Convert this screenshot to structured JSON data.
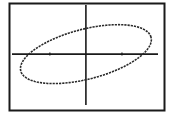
{
  "chart_data": {
    "type": "line",
    "title": "",
    "xlabel": "",
    "ylabel": "",
    "xlim": [
      -2.05,
      2.0
    ],
    "ylim": [
      -1.45,
      1.4
    ],
    "grid": false,
    "x_ticks": [
      -1,
      1
    ],
    "y_ticks": [],
    "series": [
      {
        "name": "ellipse",
        "kind": "ellipse",
        "center": [
          0,
          0
        ],
        "semi_major": 1.87,
        "semi_minor": 0.71,
        "rotation_deg": 15,
        "style": "dotted",
        "x_intercepts": [
          -1.58,
          1.58
        ],
        "y_intercepts": [
          -0.74,
          0.74
        ]
      }
    ],
    "colors": {
      "curve": "#2a2a2a",
      "axes": "#1a1a1a",
      "frame": "#1a1a1a",
      "background": "#ffffff"
    }
  }
}
